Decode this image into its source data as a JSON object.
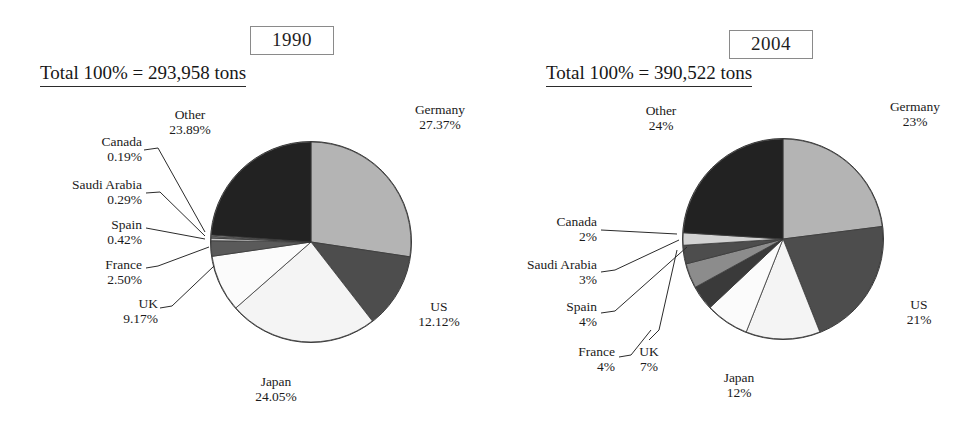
{
  "figure": {
    "type": "pie-pair",
    "background": "#ffffff"
  },
  "panels": [
    {
      "id": "1990",
      "year_label": "1990",
      "total_label": "Total 100% = 293,958 tons"
    },
    {
      "id": "2004",
      "year_label": "2004",
      "total_label": "Total 100% = 390,522 tons"
    }
  ],
  "labels_1990": {
    "other": {
      "name": "Other",
      "pct": "23.89%"
    },
    "canada": {
      "name": "Canada",
      "pct": "0.19%"
    },
    "saudi": {
      "name": "Saudi Arabia",
      "pct": "0.29%"
    },
    "spain": {
      "name": "Spain",
      "pct": "0.42%"
    },
    "france": {
      "name": "France",
      "pct": "2.50%"
    },
    "uk": {
      "name": "UK",
      "pct": "9.17%"
    },
    "japan": {
      "name": "Japan",
      "pct": "24.05%"
    },
    "us": {
      "name": "US",
      "pct": "12.12%"
    },
    "germany": {
      "name": "Germany",
      "pct": "27.37%"
    }
  },
  "labels_2004": {
    "other": {
      "name": "Other",
      "pct": "24%"
    },
    "canada": {
      "name": "Canada",
      "pct": "2%"
    },
    "saudi": {
      "name": "Saudi Arabia",
      "pct": "3%"
    },
    "spain": {
      "name": "Spain",
      "pct": "4%"
    },
    "france": {
      "name": "France",
      "pct": "4%"
    },
    "uk": {
      "name": "UK",
      "pct": "7%"
    },
    "japan": {
      "name": "Japan",
      "pct": "12%"
    },
    "us": {
      "name": "US",
      "pct": "21%"
    },
    "germany": {
      "name": "Germany",
      "pct": "23%"
    }
  },
  "chart_data": [
    {
      "type": "pie",
      "title": "1990",
      "subtitle": "Total 100% = 293,958 tons",
      "total_tons": 293958,
      "units": "tons",
      "value_format": "percent-2dp",
      "start_angle_deg": 0,
      "direction": "clockwise",
      "legend": "labelled-with-leader-lines",
      "categories": [
        "Germany",
        "US",
        "Japan",
        "UK",
        "France",
        "Spain",
        "Saudi Arabia",
        "Canada",
        "Other"
      ],
      "values": [
        27.37,
        12.12,
        24.05,
        9.17,
        2.5,
        0.42,
        0.29,
        0.19,
        23.89
      ],
      "labels": [
        "27.37%",
        "12.12%",
        "24.05%",
        "9.17%",
        "2.50%",
        "0.42%",
        "0.29%",
        "0.19%",
        "23.89%"
      ],
      "colors": [
        "#b4b4b4",
        "#4d4d4d",
        "#f4f4f4",
        "#fbfbfb",
        "#5a5a5a",
        "#c9c9c9",
        "#6e6e6e",
        "#efefef",
        "#222222"
      ]
    },
    {
      "type": "pie",
      "title": "2004",
      "subtitle": "Total 100% = 390,522 tons",
      "total_tons": 390522,
      "units": "tons",
      "value_format": "percent-0dp",
      "start_angle_deg": 0,
      "direction": "clockwise",
      "legend": "labelled-with-leader-lines",
      "categories": [
        "Germany",
        "US",
        "Japan",
        "UK",
        "France",
        "Spain",
        "Saudi Arabia",
        "Canada",
        "Other"
      ],
      "values": [
        23,
        21,
        12,
        7,
        4,
        4,
        3,
        2,
        24
      ],
      "labels": [
        "23%",
        "21%",
        "12%",
        "7%",
        "4%",
        "4%",
        "3%",
        "2%",
        "24%"
      ],
      "colors": [
        "#b4b4b4",
        "#4d4d4d",
        "#f4f4f4",
        "#fbfbfb",
        "#3a3a3a",
        "#8c8c8c",
        "#4d4d4d",
        "#d2d2d2",
        "#222222"
      ]
    }
  ]
}
